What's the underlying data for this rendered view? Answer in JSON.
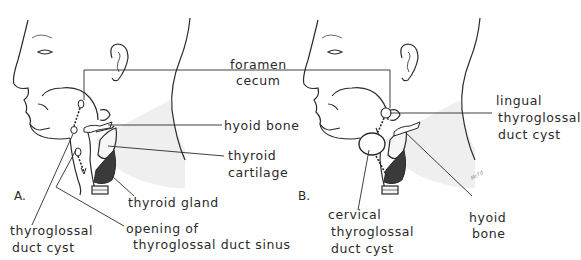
{
  "figure": {
    "panels": [
      {
        "letter": "A.",
        "labels": {
          "foramen_cecum_1": "foramen",
          "foramen_cecum_2": "cecum",
          "hyoid_bone": "hyoid bone",
          "thyroid_cartilage_1": "thyroid",
          "thyroid_cartilage_2": "cartilage",
          "thyroid_gland": "thyroid gland",
          "thyroglossal_duct_cyst_1": "thyroglossal",
          "thyroglossal_duct_cyst_2": "duct cyst",
          "opening_sinus_1": "opening of",
          "opening_sinus_2": "thyroglossal duct sinus"
        }
      },
      {
        "letter": "B.",
        "signature": "McTd",
        "labels": {
          "lingual_cyst_1": "lingual",
          "lingual_cyst_2": "thyroglossal",
          "lingual_cyst_3": "duct cyst",
          "cervical_cyst_1": "cervical",
          "cervical_cyst_2": "thyroglossal",
          "cervical_cyst_3": "duct cyst",
          "hyoid_bone_1": "hyoid",
          "hyoid_bone_2": "bone"
        }
      }
    ],
    "colors": {
      "line": "#2a2a2a",
      "neck_shade": "#ececec",
      "thyroid_gland_fill": "#3a3a3a"
    }
  }
}
